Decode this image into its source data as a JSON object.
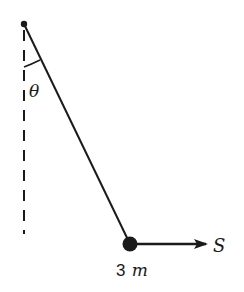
{
  "diagram": {
    "type": "pendulum-force-diagram",
    "angle_label": "θ",
    "mass_label_number": "3",
    "mass_label_unit": "m",
    "force_label": "S",
    "colors": {
      "ink": "#1a1a1a",
      "background": "#ffffff"
    }
  }
}
